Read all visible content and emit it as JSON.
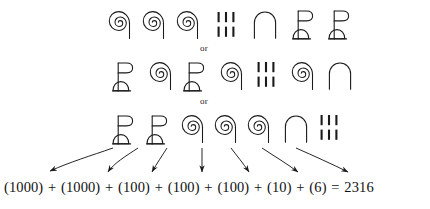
{
  "figure": {
    "title_visible": false,
    "connector_or_1": "or",
    "connector_or_2": "or",
    "ink_color": "#1a1a1a",
    "background_color": "#ffffff"
  },
  "glyph_values": {
    "lotus": "1000",
    "coil": "100",
    "arch": "10",
    "strokes": "6"
  },
  "rows": [
    {
      "id": "row-1",
      "glyphs": [
        {
          "name": "coil-glyph",
          "value": "100"
        },
        {
          "name": "coil-glyph",
          "value": "100"
        },
        {
          "name": "coil-glyph",
          "value": "100"
        },
        {
          "name": "strokes-glyph",
          "value": "6"
        },
        {
          "name": "arch-glyph",
          "value": "10"
        },
        {
          "name": "lotus-glyph",
          "value": "1000"
        },
        {
          "name": "lotus-glyph",
          "value": "1000"
        }
      ]
    },
    {
      "id": "row-2",
      "glyphs": [
        {
          "name": "lotus-glyph",
          "value": "1000"
        },
        {
          "name": "coil-glyph",
          "value": "100"
        },
        {
          "name": "lotus-glyph",
          "value": "1000"
        },
        {
          "name": "coil-glyph",
          "value": "100"
        },
        {
          "name": "strokes-glyph",
          "value": "6"
        },
        {
          "name": "coil-glyph",
          "value": "100"
        },
        {
          "name": "arch-glyph",
          "value": "10"
        }
      ]
    },
    {
      "id": "row-3",
      "glyphs": [
        {
          "name": "lotus-glyph",
          "value": "1000"
        },
        {
          "name": "lotus-glyph",
          "value": "1000"
        },
        {
          "name": "coil-glyph",
          "value": "100"
        },
        {
          "name": "coil-glyph",
          "value": "100"
        },
        {
          "name": "coil-glyph",
          "value": "100"
        },
        {
          "name": "arch-glyph",
          "value": "10"
        },
        {
          "name": "strokes-glyph",
          "value": "6"
        }
      ]
    }
  ],
  "formula": {
    "terms": [
      "(1000)",
      "(1000)",
      "(100)",
      "(100)",
      "(100)",
      "(10)",
      "(6)"
    ],
    "plus": "+",
    "equals": "=",
    "result": "2316",
    "full_text": "(1000) + (1000) + (100) + (100) + (100) + (10) + (6) = 2316"
  }
}
